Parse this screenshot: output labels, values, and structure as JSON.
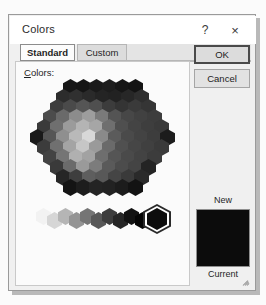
{
  "dialog": {
    "title": "Colors",
    "help_icon": "?",
    "close_icon": "×",
    "tabs": [
      {
        "label": "Standard",
        "selected": true
      },
      {
        "label": "Custom",
        "selected": false
      }
    ],
    "buttons": {
      "ok": "OK",
      "cancel": "Cancel"
    },
    "colors_label_accel": "C",
    "colors_label_rest": "olors:",
    "preview": {
      "new_label": "New",
      "current_label": "Current",
      "new_color": "#0c0c0c",
      "current_color": "#0c0c0c"
    },
    "selected_swatch": {
      "name": "black",
      "color": "#0d0d0d",
      "outline_color": "#2a2a2a"
    },
    "resize_grip_icon": "resize-grip-icon"
  },
  "palette": {
    "note": "Office Standard-colors honeycomb rendered as a grayscale scan",
    "hex_width": 15,
    "hex_height": 17,
    "col_step": 13,
    "row_step": 13,
    "rows": [
      {
        "offset_x": 39,
        "colors": [
          "#171717",
          "#151515",
          "#1a1a1a",
          "#1d1d1d",
          "#161616",
          "#131313"
        ]
      },
      {
        "offset_x": 32,
        "colors": [
          "#2c2c2c",
          "#303030",
          "#2a2a2a",
          "#242424",
          "#222222",
          "#272727",
          "#2e2e2e"
        ]
      },
      {
        "offset_x": 26,
        "colors": [
          "#3d3d3d",
          "#4a4a4a",
          "#555555",
          "#4f4f4f",
          "#3c3c3c",
          "#343434",
          "#3a3a3a",
          "#353535"
        ]
      },
      {
        "offset_x": 19,
        "colors": [
          "#4c4c4c",
          "#6a6a6a",
          "#8c8c8c",
          "#9d9d9d",
          "#7a7a7a",
          "#545454",
          "#474747",
          "#414141",
          "#3d3d3d"
        ]
      },
      {
        "offset_x": 13,
        "colors": [
          "#3a3a3a",
          "#6f6f6f",
          "#9b9b9b",
          "#b4b4b4",
          "#a6a6a6",
          "#6f6f6f",
          "#4f4f4f",
          "#444444",
          "#3e3e3e",
          "#3a3a3a"
        ]
      },
      {
        "offset_x": 6,
        "colors": [
          "#1a1a1a",
          "#565656",
          "#8f8f8f",
          "#b9b9b9",
          "#d8d8d8",
          "#8a8a8a",
          "#5b5b5b",
          "#4a4a4a",
          "#434343",
          "#3d3d3d",
          "#1c1c1c"
        ]
      },
      {
        "offset_x": 13,
        "colors": [
          "#3c3c3c",
          "#707070",
          "#a4a4a4",
          "#c6c6c6",
          "#9a9a9a",
          "#6a6a6a",
          "#505050",
          "#464646",
          "#404040",
          "#3a3a3a"
        ]
      },
      {
        "offset_x": 19,
        "colors": [
          "#434343",
          "#757575",
          "#b0b0b0",
          "#a2a2a2",
          "#6e6e6e",
          "#555555",
          "#4a4a4a",
          "#434343",
          "#3c3c3c"
        ]
      },
      {
        "offset_x": 26,
        "colors": [
          "#3a3a3a",
          "#6b6b6b",
          "#9a9a9a",
          "#7c7c7c",
          "#5a5a5a",
          "#4c4c4c",
          "#444444",
          "#242424"
        ]
      },
      {
        "offset_x": 32,
        "colors": [
          "#262626",
          "#3e3e3e",
          "#5e5e5e",
          "#585858",
          "#454545",
          "#3a3a3a",
          "#2a2a2a"
        ]
      },
      {
        "offset_x": 39,
        "colors": [
          "#141414",
          "#1d1d1d",
          "#242424",
          "#222222",
          "#1c1c1c",
          "#131313"
        ]
      }
    ],
    "gray_ramp": [
      "#f2f2f2",
      "#d6d6d6",
      "#b5b5b5",
      "#949494",
      "#757575",
      "#585858",
      "#3d3d3d",
      "#262626",
      "#121212",
      "#050505"
    ]
  }
}
